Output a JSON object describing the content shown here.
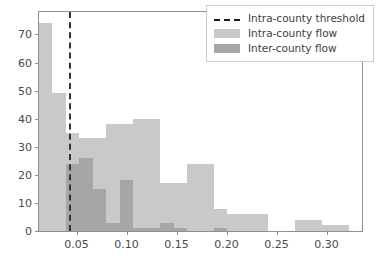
{
  "chart_data": {
    "type": "bar",
    "title": "",
    "xlabel": "",
    "ylabel": "",
    "xlim": [
      0.0125,
      0.3355
    ],
    "ylim": [
      0,
      78
    ],
    "grid": false,
    "legend_position": "upper right",
    "bin_width": 0.01346,
    "x_ticks": [
      "0.05",
      "0.10",
      "0.15",
      "0.20",
      "0.25",
      "0.30"
    ],
    "x_tick_values": [
      0.05,
      0.1,
      0.15,
      0.2,
      0.25,
      0.3
    ],
    "y_ticks": [
      "0",
      "10",
      "20",
      "30",
      "40",
      "50",
      "60",
      "70"
    ],
    "y_tick_values": [
      0,
      10,
      20,
      30,
      40,
      50,
      60,
      70
    ],
    "bin_edges": [
      0.0125,
      0.02596,
      0.03942,
      0.05288,
      0.06634,
      0.0798,
      0.09326,
      0.10672,
      0.12018,
      0.13364,
      0.1471,
      0.16056,
      0.17402,
      0.18748,
      0.20094,
      0.2144,
      0.22786,
      0.24132,
      0.25478,
      0.26824,
      0.2817,
      0.29516,
      0.30862,
      0.32208,
      0.3355
    ],
    "annotations": [
      {
        "name": "intra-county-threshold",
        "type": "vline",
        "x": 0.042,
        "style": "dashed",
        "color": "#333333"
      }
    ],
    "series": [
      {
        "name": "Intra-county flow",
        "color": "#c9c9c9",
        "values": [
          74,
          49,
          35,
          33,
          33,
          38,
          38,
          40,
          40,
          17,
          17,
          24,
          24,
          8,
          6,
          6,
          6,
          0,
          0,
          4,
          4,
          2,
          2,
          0
        ]
      },
      {
        "name": "Inter-county flow",
        "color": "#a6a6a6",
        "values": [
          0,
          0,
          24,
          26,
          15,
          3,
          18,
          1,
          1,
          3,
          1,
          0,
          0,
          1,
          0,
          0,
          0,
          0,
          0,
          0,
          0,
          0,
          0,
          0
        ]
      }
    ]
  },
  "legend": {
    "items": [
      {
        "label": "Intra-county threshold",
        "sample": "dashed-line"
      },
      {
        "label": "Intra-county flow",
        "sample": "patch-light"
      },
      {
        "label": "Inter-county flow",
        "sample": "patch-dark"
      }
    ]
  }
}
